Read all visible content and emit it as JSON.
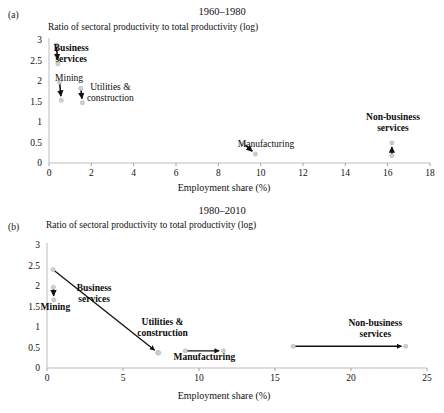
{
  "figure": {
    "panels": [
      {
        "letter": "(a)",
        "title": "1960–1980",
        "ylabel": "Ratio of sectoral productivity to total productivity (log)",
        "xlabel": "Employment share (%)"
      },
      {
        "letter": "(b)",
        "title": "1980–2010",
        "ylabel": "Ratio of sectoral productivity to total productivity (log)",
        "xlabel": "Employment share (%)"
      }
    ]
  },
  "chart_data": [
    {
      "type": "scatter",
      "panel": "a",
      "title": "1960–1980",
      "xlabel": "Employment share (%)",
      "ylabel": "Ratio of sectoral productivity to total productivity (log)",
      "xlim": [
        0,
        18
      ],
      "ylim": [
        0,
        3
      ],
      "xticks": [
        0,
        2,
        4,
        6,
        8,
        10,
        12,
        14,
        16,
        18
      ],
      "yticks": [
        0,
        0.5,
        1,
        1.5,
        2,
        2.5,
        3
      ],
      "xtick_labels": [
        "0",
        "2",
        "4",
        "6",
        "8",
        "10",
        "12",
        "14",
        "16",
        "18"
      ],
      "ytick_labels": [
        "0",
        "0.5",
        "1",
        "1.5",
        "2",
        "2.5",
        "3"
      ],
      "grid": false,
      "legend": "none",
      "annotation_style": "arrow from start year point to end year point",
      "series": [
        {
          "name": "Business services",
          "bold": true,
          "start": {
            "x": 0.35,
            "y": 2.88
          },
          "end": {
            "x": 0.42,
            "y": 2.42
          },
          "label_x": 1.05,
          "label_y": 2.72,
          "label_lines": [
            "Business",
            "services"
          ]
        },
        {
          "name": "Mining",
          "bold": false,
          "start": {
            "x": 0.5,
            "y": 1.97
          },
          "end": {
            "x": 0.58,
            "y": 1.53
          },
          "label_x": 0.95,
          "label_y": 1.99,
          "label_lines": [
            "Mining"
          ]
        },
        {
          "name": "Utilities & construction",
          "bold": false,
          "start": {
            "x": 1.5,
            "y": 1.82
          },
          "end": {
            "x": 1.58,
            "y": 1.47
          },
          "label_x": 2.9,
          "label_y": 1.77,
          "label_lines": [
            "Utilities &",
            "construction"
          ]
        },
        {
          "name": "Manufacturing",
          "bold": false,
          "start": {
            "x": 9.2,
            "y": 0.47
          },
          "end": {
            "x": 9.75,
            "y": 0.22
          },
          "label_x": 10.25,
          "label_y": 0.38,
          "label_lines": [
            "Manufacturing"
          ]
        },
        {
          "name": "Non-business services",
          "bold": true,
          "start": {
            "x": 16.2,
            "y": 0.18
          },
          "end": {
            "x": 16.2,
            "y": 0.49
          },
          "label_x": 16.25,
          "label_y": 1.05,
          "label_lines": [
            "Non-business",
            "services"
          ]
        }
      ]
    },
    {
      "type": "scatter",
      "panel": "b",
      "title": "1980–2010",
      "xlabel": "Employment share (%)",
      "ylabel": "Ratio of sectoral productivity to total productivity (log)",
      "xlim": [
        0,
        25
      ],
      "ylim": [
        0,
        3
      ],
      "xticks": [
        0,
        5,
        10,
        15,
        20,
        25
      ],
      "yticks": [
        0,
        0.5,
        1,
        1.5,
        2,
        2.5,
        3
      ],
      "xtick_labels": [
        "0",
        "5",
        "10",
        "15",
        "20",
        "25"
      ],
      "ytick_labels": [
        "0",
        "0.5",
        "1",
        "1.5",
        "2",
        "2.5",
        "3"
      ],
      "grid": false,
      "legend": "none",
      "annotation_style": "arrow from start year point to end year point",
      "series": [
        {
          "name": "Business services",
          "bold": true,
          "start": {
            "x": 0.4,
            "y": 2.4
          },
          "end": {
            "x": 7.3,
            "y": 0.37
          },
          "label_x": 3.1,
          "label_y": 1.88,
          "label_lines": [
            "Business",
            "services"
          ]
        },
        {
          "name": "Mining",
          "bold": true,
          "start": {
            "x": 0.42,
            "y": 1.97
          },
          "end": {
            "x": 0.45,
            "y": 1.66
          },
          "label_x": 0.55,
          "label_y": 1.41,
          "label_lines": [
            "Mining"
          ]
        },
        {
          "name": "Utilities & construction",
          "bold": true,
          "start": {
            "x": 7.3,
            "y": 0.37
          },
          "end": {
            "x": 7.35,
            "y": 0.37
          },
          "label_x": 7.6,
          "label_y": 1.05,
          "label_lines": [
            "Utilities &",
            "construction"
          ]
        },
        {
          "name": "Manufacturing",
          "bold": true,
          "start": {
            "x": 9.1,
            "y": 0.42
          },
          "end": {
            "x": 11.6,
            "y": 0.42
          },
          "label_x": 10.35,
          "label_y": 0.19,
          "label_lines": [
            "Manufacturing"
          ]
        },
        {
          "name": "Non-business services",
          "bold": true,
          "start": {
            "x": 16.2,
            "y": 0.53
          },
          "end": {
            "x": 23.6,
            "y": 0.53
          },
          "label_x": 21.6,
          "label_y": 1.03,
          "label_lines": [
            "Non-business",
            "services"
          ]
        }
      ]
    }
  ]
}
